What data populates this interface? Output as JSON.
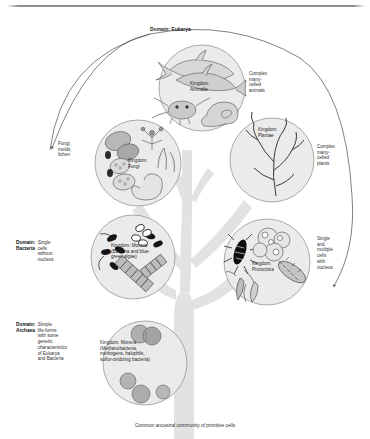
{
  "figure": {
    "title": "Domain: Eukarya",
    "caption": "Common ancestral community of primitive cells",
    "colors": {
      "trunk": "#e2e2e2",
      "circle_fill": "#ebebeb",
      "circle_stroke": "#8a8a8a",
      "text": "#2f2f2f",
      "rule": "#8d8d8d"
    }
  },
  "domains": [
    {
      "name": "Domain:\nBacteria",
      "description": "Single\ncells\nwithout\nnucleus"
    },
    {
      "name": "Domain:\nArchaea",
      "description": "Simple\nlife-forms\nwith some\ngenetic\ncharacteristics\nof Eukarya\nand Bacteria"
    }
  ],
  "kingdoms": [
    {
      "id": "animalia",
      "label": "Kingdom:\nAnimalia",
      "note": "Complex\nmany-\ncelled\nanimals",
      "illustrations": [
        "whale",
        "dolphin",
        "crab",
        "snail"
      ]
    },
    {
      "id": "fungi",
      "label": "Kingdom:\nFungi",
      "note": "Fungi,\nmolds,\nlichen",
      "illustrations": [
        "mushroom-caps",
        "spore-sacs",
        "branching-hyphae",
        "coiled-fungus"
      ]
    },
    {
      "id": "plantae",
      "label": "Kingdom:\nPlantae",
      "note": "Complex\nmany-\ncelled\nplants",
      "illustrations": [
        "seaweed",
        "branching-alga"
      ]
    },
    {
      "id": "monera-bacteria",
      "label": "Kingdom: Monera\n(Bacteria and blue-\ngreen algae)",
      "note": "",
      "illustrations": [
        "rod-bacteria",
        "cocci-chains",
        "filament-chain"
      ]
    },
    {
      "id": "protoctista",
      "label": "Kingdom:\nProtoctista",
      "note": "Single\nand\nmultiple\ncells\nwith\nnucleus",
      "illustrations": [
        "diatom",
        "volvox-colony",
        "paramecium",
        "flagellate",
        "euglena"
      ]
    },
    {
      "id": "monera-archaea",
      "label": "Kingdom: Monera\n(Methanobacteria,\nmethogens, halophils,\nsulfur-oxidizing bacteria)",
      "note": "",
      "illustrations": [
        "round-cells",
        "dividing-cell"
      ]
    }
  ]
}
